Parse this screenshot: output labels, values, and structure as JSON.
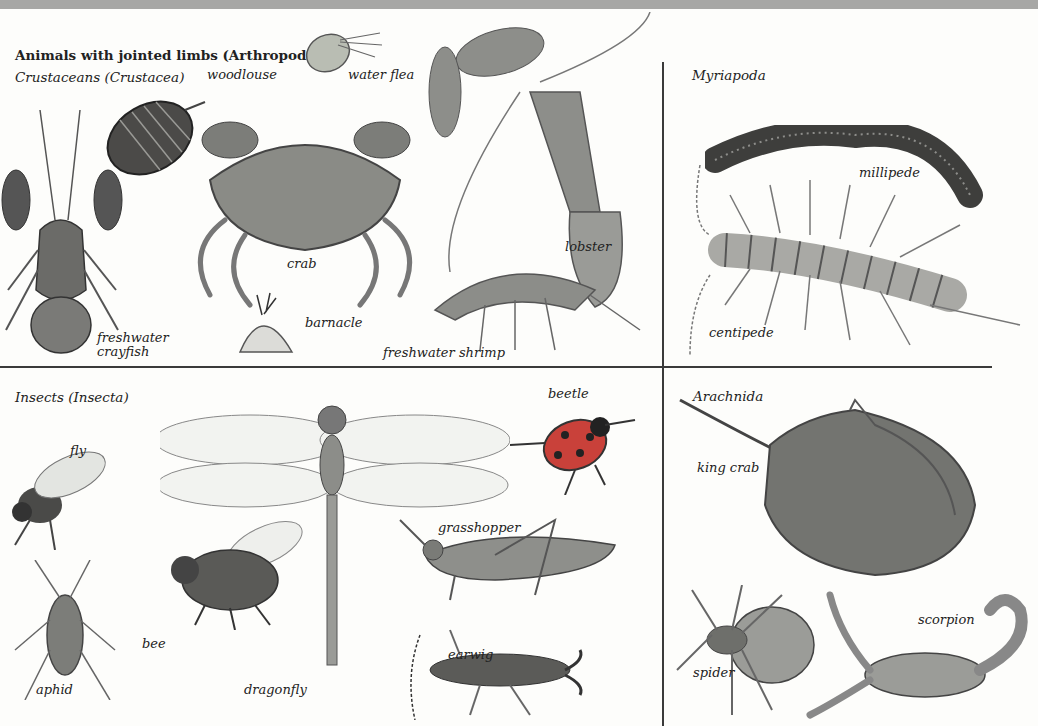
{
  "title": "Animals with jointed limbs (Arthropoda)",
  "sections": {
    "crustaceans": {
      "heading": "Crustaceans (Crustacea)",
      "animals": [
        "woodlouse",
        "water flea",
        "crab",
        "lobster",
        "freshwater crayfish",
        "barnacle",
        "freshwater shrimp"
      ]
    },
    "myriapoda": {
      "heading": "Myriapoda",
      "animals": [
        "millipede",
        "centipede"
      ]
    },
    "insects": {
      "heading": "Insects (Insecta)",
      "animals": [
        "fly",
        "beetle",
        "grasshopper",
        "aphid",
        "bee",
        "dragonfly",
        "earwig"
      ]
    },
    "arachnida": {
      "heading": "Arachnida",
      "animals": [
        "king crab",
        "spider",
        "scorpion"
      ]
    }
  },
  "labels": {
    "woodlouse": "woodlouse",
    "water_flea": "water flea",
    "crab": "crab",
    "lobster": "lobster",
    "crayfish_1": "freshwater",
    "crayfish_2": "crayfish",
    "barnacle": "barnacle",
    "shrimp": "freshwater shrimp",
    "millipede": "millipede",
    "centipede": "centipede",
    "fly": "fly",
    "beetle": "beetle",
    "grasshopper": "grasshopper",
    "aphid": "aphid",
    "bee": "bee",
    "dragonfly": "dragonfly",
    "earwig": "earwig",
    "king_crab": "king crab",
    "spider": "spider",
    "scorpion": "scorpion"
  },
  "colors": {
    "background": "#fdfdfb",
    "top_strip": "#a7a7a5",
    "divider": "#3a3a3a",
    "beetle_red": "#c9413a"
  }
}
